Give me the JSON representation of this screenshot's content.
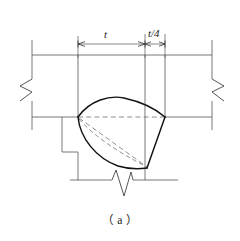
{
  "figure": {
    "caption": "（ a ）",
    "type": "engineering-detail-drawing",
    "colors": {
      "outline": "#111111",
      "thin_line": "#555555",
      "hidden_line": "#777777",
      "background": "#ffffff"
    }
  },
  "dimensions": {
    "main_width": {
      "label": "t",
      "start_x": 78,
      "end_x": 145,
      "y": 44
    },
    "secondary_width": {
      "label": "t/4",
      "start_x": 145,
      "end_x": 165,
      "y": 44
    }
  },
  "geometry": {
    "plate": {
      "top_line_y": 55,
      "mid_line_y": 117,
      "bottom_line_y": 180,
      "left_edge_x": 32,
      "right_edge_x": 212
    },
    "verticals": [
      78,
      145,
      165
    ],
    "gouge": {
      "left_apex": [
        78,
        117
      ],
      "right_vertex": [
        165,
        117
      ],
      "bottom_vertex": [
        147,
        168
      ],
      "crest_peak": [
        122,
        99
      ]
    }
  },
  "annotations": {
    "break_symbol_left": "zigzag-break",
    "break_symbol_right": "zigzag-break",
    "break_symbol_bottom": "zigzag-break"
  }
}
